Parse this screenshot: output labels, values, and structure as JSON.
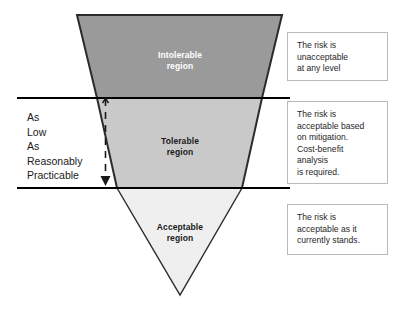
{
  "diagram": {
    "colors": {
      "intolerable_fill": "#9a9a9a",
      "tolerable_fill": "#c9c9c9",
      "acceptable_fill": "#efefef",
      "outline": "#2b2b2b",
      "divider_line": "#000000",
      "note_border": "#b9b9b9",
      "intolerable_text": "#ffffff",
      "body_text": "#1a1a1a",
      "background": "#ffffff"
    },
    "regions": [
      {
        "id": "intolerable",
        "label": "Intolerable\nregion",
        "fill": "#9a9a9a",
        "note": {
          "lines": [
            "The risk is",
            "unacceptable",
            "at any level"
          ]
        }
      },
      {
        "id": "tolerable",
        "label": "Tolerable\nregion",
        "fill": "#c9c9c9",
        "note": {
          "lines": [
            "The risk is",
            "acceptable based",
            "on mitigation.",
            "Cost-benefit",
            "analysis",
            "is required."
          ]
        }
      },
      {
        "id": "acceptable",
        "label": "Acceptable\nregion",
        "fill": "#efefef",
        "note": {
          "lines": [
            "The risk is",
            "acceptable as it",
            "currently stands."
          ]
        }
      }
    ],
    "alarp": {
      "words": [
        "As",
        "Low",
        "As",
        "Reasonably",
        "Practicable"
      ],
      "arrow_direction": "down",
      "arrow_style": "dashed"
    }
  }
}
